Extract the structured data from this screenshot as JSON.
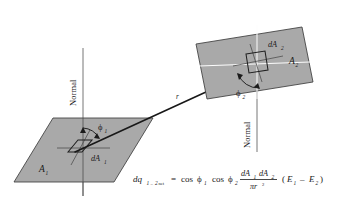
{
  "figure": {
    "background_color": "#ffffff",
    "plate_fill_color": "#a9a9a9",
    "plate_stroke_color": "#3d3d3d",
    "ray_color": "#181818",
    "white_line_color": "#fdfdfd"
  },
  "labels": {
    "normal_1": "Normal",
    "normal_2": "Normal",
    "area_1": "A",
    "area_1_sub": "1",
    "area_2": "A",
    "area_2_sub": "2",
    "dA_1": "dA",
    "dA_1_sub": "1",
    "dA_2": "dA",
    "dA_2_sub": "2",
    "phi_1": "ϕ",
    "phi_1_sub": "1",
    "phi_2": "ϕ",
    "phi_2_sub": "2",
    "distance": "r"
  },
  "equation": {
    "lhs_symbol": "dq",
    "lhs_sub_1": "1",
    "lhs_dash": "–",
    "lhs_sub_2": "2",
    "lhs_sub_net": "net",
    "equals": "=",
    "cos_1": "cos",
    "cos_1_phi": "ϕ",
    "cos_1_sub": "1",
    "cos_2": "cos",
    "cos_2_phi": "ϕ",
    "cos_2_sub": "2",
    "numerator_a": "dA",
    "numerator_a_sub": "1",
    "numerator_b": "dA",
    "numerator_b_sub": "2",
    "denominator": "πr",
    "denominator_exp": "2",
    "paren_open": "(",
    "E_1": "E",
    "E_1_sub": "1",
    "minus": "–",
    "E_2": "E",
    "E_2_sub": "2",
    "paren_close": ")",
    "full_text": "dq(1-2)net = cos ϕ1 cos ϕ2 (dA1 dA2)/(πr²) (E1 – E2)"
  }
}
